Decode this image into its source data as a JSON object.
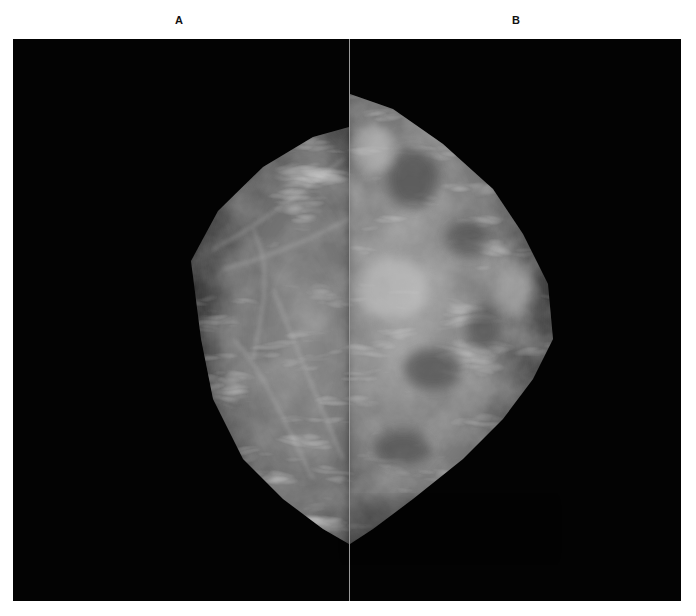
{
  "figure": {
    "panels": [
      {
        "label": "A",
        "view": "left image"
      },
      {
        "label": "B",
        "view": "right image"
      }
    ],
    "background_color": "#030303",
    "divider_color": "#9a9a9a"
  }
}
